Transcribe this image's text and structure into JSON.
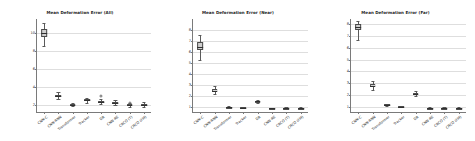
{
  "figure": {
    "background": "#ffffff",
    "box_fill": "#cfcfcf",
    "box_edge": "#4a4a4a",
    "grid_color": "#dedede"
  },
  "chart_data": [
    {
      "type": "box",
      "title": "Mean Deformation Error (All)",
      "xlabel": "",
      "ylabel": "",
      "ylim": [
        1.2,
        11.6
      ],
      "yticks": [
        2,
        4,
        6,
        8,
        10
      ],
      "ytick_labels": [
        "2",
        "4",
        "6",
        "8",
        "10"
      ],
      "grid": true,
      "legend": "none",
      "categories": [
        "CNN-C",
        "CNN-RNN",
        "Transformer",
        "Tracker",
        "DR",
        "CNN-RE",
        "CRCO (T)",
        "CRCO (FM)"
      ],
      "boxes": [
        {
          "category": "CNN-C",
          "whisker_low": 8.6,
          "q1": 9.6,
          "median": 10.0,
          "q3": 10.45,
          "whisker_high": 11.2,
          "fliers": []
        },
        {
          "category": "CNN-RNN",
          "whisker_low": 2.7,
          "q1": 2.9,
          "median": 3.0,
          "q3": 3.12,
          "whisker_high": 3.45,
          "fliers": []
        },
        {
          "category": "Transformer",
          "whisker_low": 1.85,
          "q1": 1.98,
          "median": 2.02,
          "q3": 2.08,
          "whisker_high": 2.25,
          "fliers": []
        },
        {
          "category": "Tracker",
          "whisker_low": 2.25,
          "q1": 2.45,
          "median": 2.52,
          "q3": 2.6,
          "whisker_high": 2.8,
          "fliers": []
        },
        {
          "category": "DR",
          "whisker_low": 2.05,
          "q1": 2.2,
          "median": 2.28,
          "q3": 2.38,
          "whisker_high": 2.62,
          "fliers": [
            3.38
          ]
        },
        {
          "category": "CNN-RE",
          "whisker_low": 1.95,
          "q1": 2.12,
          "median": 2.2,
          "q3": 2.3,
          "whisker_high": 2.55,
          "fliers": []
        },
        {
          "category": "CRCO (T)",
          "whisker_low": 1.8,
          "q1": 1.92,
          "median": 1.98,
          "q3": 2.04,
          "whisker_high": 2.18,
          "fliers": [
            2.55
          ]
        },
        {
          "category": "CRCO (FM)",
          "whisker_low": 1.8,
          "q1": 1.94,
          "median": 2.0,
          "q3": 2.08,
          "whisker_high": 2.3,
          "fliers": []
        }
      ]
    },
    {
      "type": "box",
      "title": "Mean Deformation Error (Near)",
      "xlabel": "",
      "ylabel": "",
      "ylim": [
        0.55,
        8.95
      ],
      "yticks": [
        1,
        2,
        3,
        4,
        5,
        6,
        7,
        8
      ],
      "ytick_labels": [
        "1",
        "2",
        "3",
        "4",
        "5",
        "6",
        "7",
        "8"
      ],
      "grid": true,
      "legend": "none",
      "categories": [
        "CNN-C",
        "CNN-RNN",
        "Transformer",
        "Tracker",
        "DR",
        "CNN-RE",
        "CRCO (T)",
        "CRCO (FM)"
      ],
      "boxes": [
        {
          "category": "CNN-C",
          "whisker_low": 5.25,
          "q1": 6.15,
          "median": 6.45,
          "q3": 6.85,
          "whisker_high": 7.55,
          "fliers": []
        },
        {
          "category": "CNN-RNN",
          "whisker_low": 2.15,
          "q1": 2.38,
          "median": 2.48,
          "q3": 2.6,
          "whisker_high": 2.92,
          "fliers": []
        },
        {
          "category": "Transformer",
          "whisker_low": 0.92,
          "q1": 0.98,
          "median": 1.0,
          "q3": 1.03,
          "whisker_high": 1.1,
          "fliers": []
        },
        {
          "category": "Tracker",
          "whisker_low": 0.88,
          "q1": 0.93,
          "median": 0.95,
          "q3": 0.97,
          "whisker_high": 1.02,
          "fliers": []
        },
        {
          "category": "DR",
          "whisker_low": 1.4,
          "q1": 1.48,
          "median": 1.52,
          "q3": 1.56,
          "whisker_high": 1.66,
          "fliers": []
        },
        {
          "category": "CNN-RE",
          "whisker_low": 0.82,
          "q1": 0.86,
          "median": 0.88,
          "q3": 0.9,
          "whisker_high": 0.95,
          "fliers": []
        },
        {
          "category": "CRCO (T)",
          "whisker_low": 0.82,
          "q1": 0.86,
          "median": 0.88,
          "q3": 0.91,
          "whisker_high": 0.97,
          "fliers": []
        },
        {
          "category": "CRCO (FM)",
          "whisker_low": 0.82,
          "q1": 0.87,
          "median": 0.89,
          "q3": 0.92,
          "whisker_high": 0.98,
          "fliers": []
        }
      ]
    },
    {
      "type": "box",
      "title": "Mean Deformation Error (Far)",
      "xlabel": "",
      "ylabel": "",
      "ylim": [
        0.55,
        8.45
      ],
      "yticks": [
        1,
        2,
        3,
        4,
        5,
        6,
        7,
        8
      ],
      "ytick_labels": [
        "1",
        "2",
        "3",
        "4",
        "5",
        "6",
        "7",
        "8"
      ],
      "grid": true,
      "legend": "none",
      "categories": [
        "CNN-C",
        "CNN-RNN",
        "Transformer",
        "Tracker",
        "DR",
        "CNN-RE",
        "CRCO (T)",
        "CRCO (FM)"
      ],
      "boxes": [
        {
          "category": "CNN-C",
          "whisker_low": 6.7,
          "q1": 7.5,
          "median": 7.8,
          "q3": 8.0,
          "whisker_high": 8.25,
          "fliers": []
        },
        {
          "category": "CNN-RNN",
          "whisker_low": 2.42,
          "q1": 2.7,
          "median": 2.8,
          "q3": 2.9,
          "whisker_high": 3.15,
          "fliers": []
        },
        {
          "category": "Transformer",
          "whisker_low": 1.08,
          "q1": 1.14,
          "median": 1.16,
          "q3": 1.19,
          "whisker_high": 1.26,
          "fliers": []
        },
        {
          "category": "Tracker",
          "whisker_low": 0.95,
          "q1": 0.99,
          "median": 1.01,
          "q3": 1.03,
          "whisker_high": 1.08,
          "fliers": []
        },
        {
          "category": "DR",
          "whisker_low": 1.88,
          "q1": 2.02,
          "median": 2.1,
          "q3": 2.18,
          "whisker_high": 2.34,
          "fliers": []
        },
        {
          "category": "CNN-RE",
          "whisker_low": 0.82,
          "q1": 0.86,
          "median": 0.88,
          "q3": 0.9,
          "whisker_high": 0.96,
          "fliers": []
        },
        {
          "category": "CRCO (T)",
          "whisker_low": 0.82,
          "q1": 0.86,
          "median": 0.88,
          "q3": 0.91,
          "whisker_high": 0.97,
          "fliers": []
        },
        {
          "category": "CRCO (FM)",
          "whisker_low": 0.82,
          "q1": 0.87,
          "median": 0.89,
          "q3": 0.92,
          "whisker_high": 0.98,
          "fliers": []
        }
      ]
    }
  ]
}
